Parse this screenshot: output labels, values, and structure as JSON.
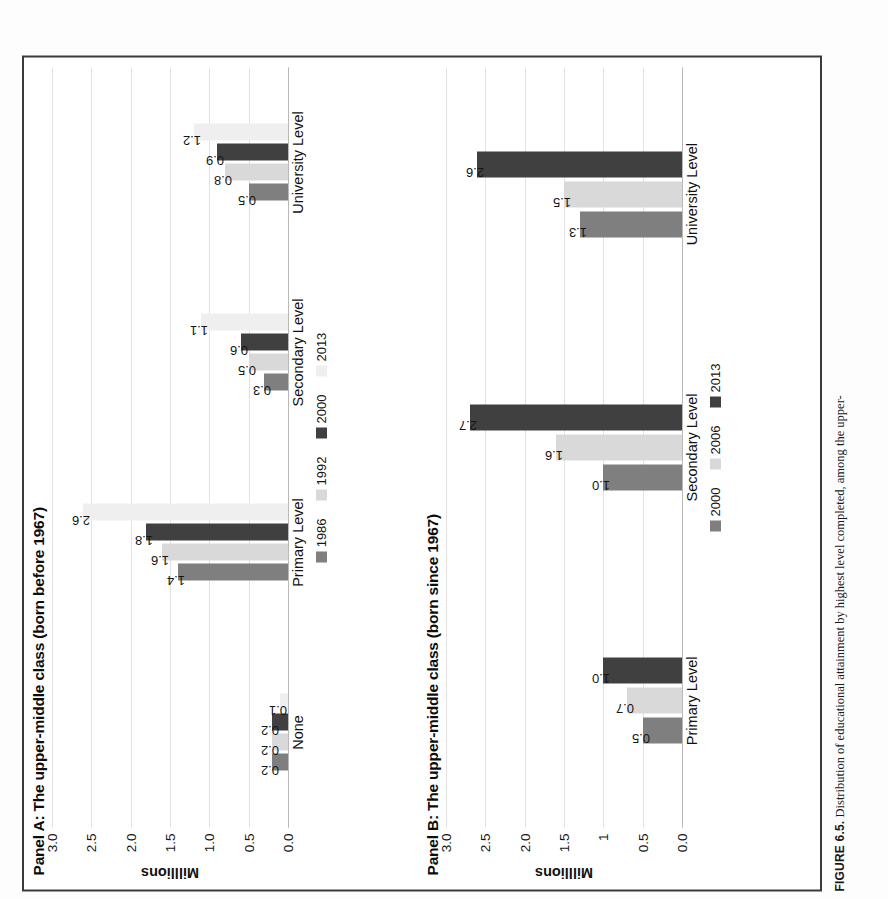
{
  "figure": {
    "caption_label": "FIGURE 6.5.",
    "caption_text": "Distribution of educational attainment by highest level completed, among the upper-"
  },
  "colors": {
    "s1": "#7f7f7f",
    "s2": "#d9d9d9",
    "s3": "#404040",
    "s4": "#efefef",
    "b1": "#7f7f7f",
    "b2": "#d9d9d9",
    "b3": "#404040",
    "gridline": "#e2e2e2",
    "axis": "#b9b9b9",
    "frame": "#3a3a3a"
  },
  "panelA": {
    "title": "Panel A: The upper-middle class (born before 1967)",
    "ylabel": "Milllions",
    "yticks": [
      "3.0",
      "2.5",
      "2.0",
      "1.5",
      "1.0",
      "0.5",
      "0.0"
    ]
  },
  "panelB": {
    "title": "Panel B: The upper-middle class (born since 1967)",
    "ylabel": "Milllions",
    "yticks": [
      "3.0",
      "2.5",
      "2.0",
      "1.5",
      "1",
      "0.5",
      "0.0"
    ]
  },
  "chart_data": [
    {
      "type": "bar",
      "title": "Panel A: The upper-middle class (born before 1967)",
      "xlabel": "",
      "ylabel": "Milllions",
      "ylim": [
        0,
        3.0
      ],
      "yticks": [
        3.0,
        2.5,
        2.0,
        1.5,
        1.0,
        0.5,
        0.0
      ],
      "grid": true,
      "legend_position": "bottom",
      "categories": [
        "None",
        "Primary Level",
        "Secondary Level",
        "University Level"
      ],
      "series": [
        {
          "name": "1986",
          "values": [
            0.2,
            1.4,
            0.3,
            0.5
          ],
          "labels": [
            "0.2",
            "1.4",
            "0.3",
            "0.5"
          ],
          "color": "#7f7f7f"
        },
        {
          "name": "1992",
          "values": [
            0.2,
            1.6,
            0.5,
            0.8
          ],
          "labels": [
            "0.2",
            "1.6",
            "0.5",
            "0.8"
          ],
          "color": "#d9d9d9"
        },
        {
          "name": "2000",
          "values": [
            0.2,
            1.8,
            0.6,
            0.9
          ],
          "labels": [
            "0.2",
            "1.8",
            "0.6",
            "0.9"
          ],
          "color": "#404040"
        },
        {
          "name": "2013",
          "values": [
            0.1,
            2.6,
            1.1,
            1.2
          ],
          "labels": [
            "0.1",
            "2.6",
            "1.1",
            "1.2"
          ],
          "color": "#efefef"
        }
      ]
    },
    {
      "type": "bar",
      "title": "Panel B: The upper-middle class (born since 1967)",
      "xlabel": "",
      "ylabel": "Milllions",
      "ylim": [
        0,
        3.0
      ],
      "yticks": [
        3.0,
        2.5,
        2.0,
        1.5,
        1.0,
        0.5,
        0.0
      ],
      "ytick_labels": [
        "3.0",
        "2.5",
        "2.0",
        "1.5",
        "1",
        "0.5",
        "0.0"
      ],
      "grid": true,
      "legend_position": "bottom",
      "categories": [
        "Primary Level",
        "Secondary Level",
        "University Level"
      ],
      "series": [
        {
          "name": "2000",
          "values": [
            0.5,
            1.0,
            1.3
          ],
          "labels": [
            "0.5",
            "1.0",
            "1.3"
          ],
          "color": "#7f7f7f"
        },
        {
          "name": "2006",
          "values": [
            0.7,
            1.6,
            1.5
          ],
          "labels": [
            "0.7",
            "1.6",
            "1.5"
          ],
          "color": "#d9d9d9"
        },
        {
          "name": "2013",
          "values": [
            1.0,
            2.7,
            2.6
          ],
          "labels": [
            "1.0",
            "2.7",
            "2.6"
          ],
          "color": "#404040"
        }
      ]
    }
  ]
}
